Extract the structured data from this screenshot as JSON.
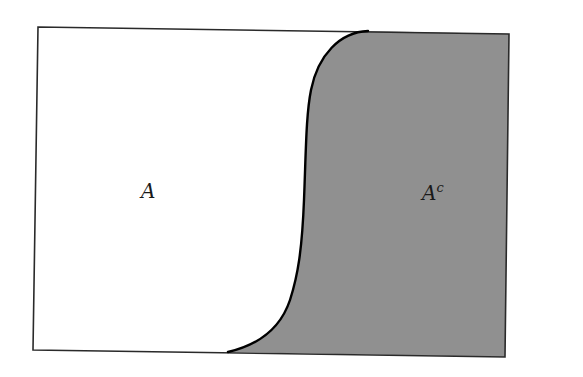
{
  "diagram": {
    "type": "set-complement",
    "universe": {
      "shape": "rectangle",
      "border_color": "#2a2a2a"
    },
    "regions": [
      {
        "id": "A",
        "label": "A",
        "fill": "#ffffff",
        "position": "left"
      },
      {
        "id": "A-complement",
        "label": "A",
        "superscript": "c",
        "fill": "#909090",
        "position": "right"
      }
    ],
    "boundary": {
      "shape": "S-curve",
      "stroke": "#000000"
    }
  }
}
